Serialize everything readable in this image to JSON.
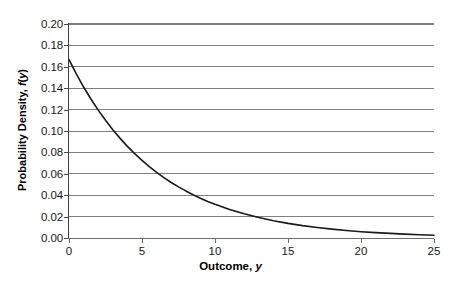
{
  "chart_data": {
    "type": "line",
    "title": "",
    "xlabel": "Outcome, y",
    "xlabel_plain": "Outcome,",
    "xlabel_var": "y",
    "ylabel": "Probability Density, f(y)",
    "ylabel_plain_a": "Probability Density, ",
    "ylabel_var_f": "f",
    "ylabel_paren_open": "(",
    "ylabel_var_y": "y",
    "ylabel_paren_close": ")",
    "xlim": [
      0,
      25
    ],
    "ylim": [
      0,
      0.2
    ],
    "grid": "horizontal",
    "legend": "none",
    "xticks": [
      0,
      5,
      10,
      15,
      20,
      25
    ],
    "xtick_labels": [
      "0",
      "5",
      "10",
      "15",
      "20",
      "25"
    ],
    "yticks": [
      0.0,
      0.02,
      0.04,
      0.06,
      0.08,
      0.1,
      0.12,
      0.14,
      0.16,
      0.18,
      0.2
    ],
    "ytick_labels": [
      "0.00",
      "0.02",
      "0.04",
      "0.06",
      "0.08",
      "0.10",
      "0.12",
      "0.14",
      "0.16",
      "0.18",
      "0.20"
    ],
    "curve_color": "#1a1a1a",
    "grid_color": "#808080",
    "axis_color": "#595959",
    "background_color": "#ffffff",
    "series": [
      {
        "name": "Exponential density, mean 6",
        "description": "f(y) = (1/6) * exp(-y/6)",
        "x": [
          0,
          0.5,
          1,
          1.5,
          2,
          2.5,
          3,
          3.5,
          4,
          4.5,
          5,
          5.5,
          6,
          6.5,
          7,
          7.5,
          8,
          8.5,
          9,
          9.5,
          10,
          11,
          12,
          13,
          14,
          15,
          16,
          17,
          18,
          19,
          20,
          21,
          22,
          23,
          24,
          25
        ],
        "values": [
          0.1667,
          0.1534,
          0.1411,
          0.1299,
          0.1195,
          0.11,
          0.1011,
          0.0931,
          0.0856,
          0.0788,
          0.0725,
          0.0667,
          0.0613,
          0.0564,
          0.0519,
          0.0478,
          0.044,
          0.0404,
          0.0372,
          0.0342,
          0.0315,
          0.0266,
          0.0226,
          0.0191,
          0.0162,
          0.0137,
          0.0116,
          0.0098,
          0.0083,
          0.007,
          0.0059,
          0.005,
          0.0043,
          0.0036,
          0.0031,
          0.0026
        ]
      }
    ]
  }
}
